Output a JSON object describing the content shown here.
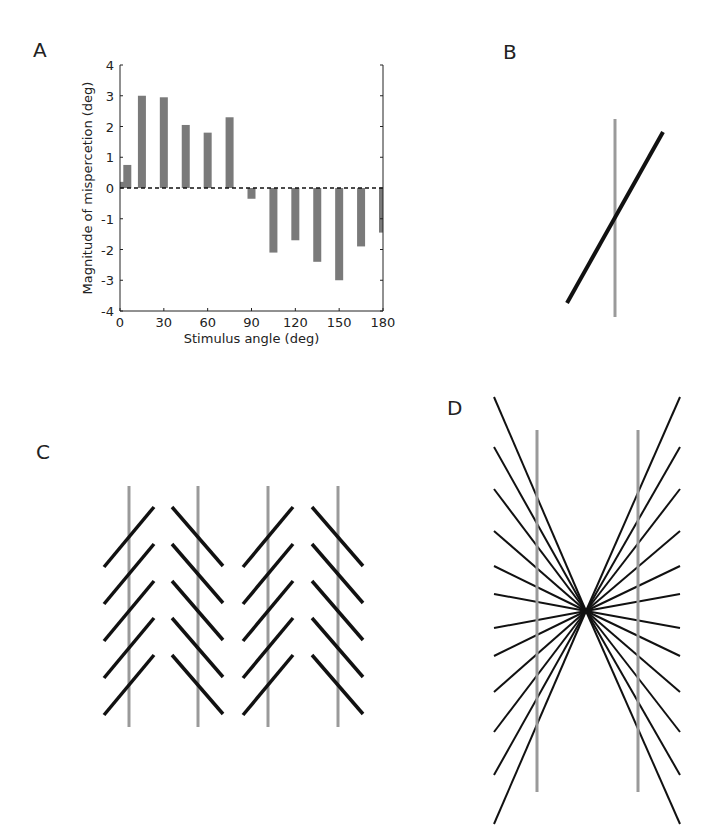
{
  "panels": {
    "A": {
      "label": "A"
    },
    "B": {
      "label": "B"
    },
    "C": {
      "label": "C"
    },
    "D": {
      "label": "D"
    }
  },
  "colors": {
    "bar": "#7a7a7a",
    "gray_line": "#9a9a9a",
    "black_line": "#111111",
    "axis": "#222222"
  },
  "chart_data": {
    "type": "bar",
    "title": "",
    "xlabel": "Stimulus angle (deg)",
    "ylabel": "Magnitude of mispercetion (deg)",
    "xlim": [
      0,
      180
    ],
    "ylim": [
      -4,
      4
    ],
    "xticks": [
      0,
      30,
      60,
      90,
      120,
      150,
      180
    ],
    "yticks": [
      4,
      3,
      2,
      1,
      0,
      -1,
      -2,
      -3,
      -4
    ],
    "zero_line": "dashed",
    "grid": false,
    "x": [
      0,
      5,
      15,
      30,
      45,
      60,
      75,
      90,
      105,
      120,
      135,
      150,
      165,
      180
    ],
    "values": [
      0.2,
      0.75,
      3.0,
      2.95,
      2.05,
      1.8,
      2.3,
      -0.35,
      -2.1,
      -1.7,
      -2.4,
      -3.0,
      -1.9,
      -1.45
    ]
  }
}
